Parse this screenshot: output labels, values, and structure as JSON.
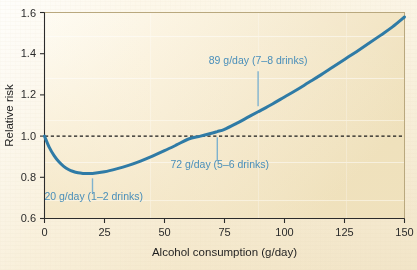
{
  "chart_data": {
    "type": "line",
    "title": "",
    "xlabel": "Alcohol consumption (g/day)",
    "ylabel": "Relative risk",
    "xlim": [
      0,
      150
    ],
    "ylim": [
      0.6,
      1.6
    ],
    "xticks": [
      0,
      25,
      50,
      75,
      100,
      125,
      150
    ],
    "xtick_labels": [
      "0",
      "25",
      "50",
      "75",
      "100",
      "125",
      "150"
    ],
    "yticks": [
      0.6,
      0.8,
      1.0,
      1.2,
      1.4,
      1.6
    ],
    "ytick_labels": [
      "0.6",
      "0.8",
      "1.0",
      "1.2",
      "1.4",
      "1.6"
    ],
    "grid": false,
    "legend": "none",
    "series": [
      {
        "name": "Relative risk",
        "color": "#2f7ba6",
        "x": [
          0,
          2,
          4,
          6,
          8,
          10,
          12,
          14,
          16,
          18,
          20,
          25,
          30,
          35,
          40,
          45,
          50,
          55,
          60,
          65,
          70,
          72,
          75,
          80,
          85,
          89,
          90,
          95,
          100,
          105,
          110,
          115,
          120,
          125,
          130,
          135,
          140,
          145,
          150
        ],
        "y": [
          1.0,
          0.945,
          0.905,
          0.875,
          0.853,
          0.838,
          0.828,
          0.822,
          0.819,
          0.818,
          0.819,
          0.827,
          0.841,
          0.858,
          0.879,
          0.903,
          0.929,
          0.957,
          0.986,
          1.0,
          1.015,
          1.022,
          1.033,
          1.062,
          1.093,
          1.118,
          1.124,
          1.156,
          1.19,
          1.224,
          1.26,
          1.296,
          1.334,
          1.372,
          1.41,
          1.449,
          1.489,
          1.53,
          1.578
        ]
      }
    ],
    "reference_line": {
      "name": "baseline-risk",
      "y": 1.0,
      "style": "dashed",
      "color": "#1a1a1a"
    },
    "annotations": [
      {
        "id": "annot-20",
        "label": "20 g/day (1–2 drinks)",
        "x": 20,
        "y": 0.819,
        "text_x": 20.5,
        "text_y": 0.688,
        "anchor": "middle",
        "leader_from_y": 0.795,
        "leader_to_y": 0.722,
        "color": "#4a8fba"
      },
      {
        "id": "annot-72",
        "label": "72 g/day (5–6 drinks)",
        "x": 72,
        "y": 1.022,
        "text_x": 73,
        "text_y": 0.845,
        "anchor": "middle",
        "leader_from_y": 0.995,
        "leader_to_y": 0.878,
        "color": "#4a8fba"
      },
      {
        "id": "annot-89",
        "label": "89 g/day (7–8 drinks)",
        "x": 89,
        "y": 1.118,
        "text_x": 89,
        "text_y": 1.35,
        "anchor": "middle",
        "leader_from_y": 1.315,
        "leader_to_y": 1.145,
        "color": "#4a8fba"
      }
    ],
    "colors": {
      "curve": "#2f7ba6",
      "annotation_text": "#4a8fba",
      "leader_line": "#7fb2ce",
      "axis": "#2b2b2b",
      "reference_line": "#1a1a1a",
      "plot_background_light": "#fdfaf2",
      "plot_background_dark": "#efdfbb",
      "page_background": "#ffffff"
    }
  }
}
